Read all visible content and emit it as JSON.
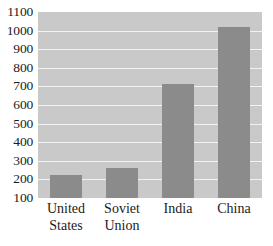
{
  "chart_data": {
    "type": "bar",
    "title": "",
    "xlabel": "",
    "ylabel": "",
    "categories": [
      "United States",
      "Soviet Union",
      "India",
      "China"
    ],
    "category_lines": [
      [
        "United",
        "States"
      ],
      [
        "Soviet",
        "Union"
      ],
      [
        "India"
      ],
      [
        "China"
      ]
    ],
    "values": [
      225,
      262,
      715,
      1020
    ],
    "ylim": [
      100,
      1100
    ],
    "yticks": [
      1100,
      1000,
      900,
      800,
      700,
      600,
      500,
      400,
      300,
      200,
      100
    ],
    "ytick_labels": [
      "1100",
      "1000",
      "900",
      "800",
      "700",
      "600",
      "500",
      "400",
      "300",
      "200",
      "100"
    ],
    "grid": true,
    "grid_axis": "y",
    "legend": false,
    "legend_position": "none",
    "bar_color": "#8b8b8b",
    "plot_background": "#c9c9c9",
    "gridline_color": "#f2f2f2",
    "text_color": "#1b1b1b"
  },
  "title_sliver": {
    "text": "",
    "note": "cropped title row, illegible"
  }
}
